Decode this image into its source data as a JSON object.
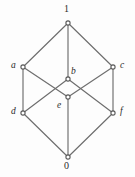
{
  "figure": {
    "kind": "hasse-diagram",
    "background_color": "#fdfdfd",
    "edge_color": "#6d6d6d",
    "vertex_fill_color": "#ffffff",
    "vertex_stroke_color": "#5a5a5a",
    "label_color": "#2b2b2b"
  },
  "nodes": [
    {
      "id": "top",
      "label": "1",
      "style": "numeral",
      "x": 68,
      "y": 23,
      "label_x": 64,
      "label_y": 4
    },
    {
      "id": "a",
      "label": "a",
      "style": "italic",
      "x": 23,
      "y": 67,
      "label_x": 11,
      "label_y": 60
    },
    {
      "id": "c",
      "label": "c",
      "style": "italic",
      "x": 113,
      "y": 67,
      "label_x": 120,
      "label_y": 60
    },
    {
      "id": "b",
      "label": "b",
      "style": "italic",
      "x": 68,
      "y": 79,
      "label_x": 71,
      "label_y": 66
    },
    {
      "id": "e",
      "label": "e",
      "style": "italic",
      "x": 68,
      "y": 97,
      "label_x": 57,
      "label_y": 100
    },
    {
      "id": "d",
      "label": "d",
      "style": "italic",
      "x": 23,
      "y": 113,
      "label_x": 11,
      "label_y": 106
    },
    {
      "id": "f",
      "label": "f",
      "style": "italic",
      "x": 113,
      "y": 113,
      "label_x": 120,
      "label_y": 106
    },
    {
      "id": "bottom",
      "label": "0",
      "style": "numeral",
      "x": 68,
      "y": 157,
      "label_x": 64,
      "label_y": 161
    }
  ],
  "edges": [
    {
      "from": "top",
      "to": "a"
    },
    {
      "from": "top",
      "to": "c"
    },
    {
      "from": "top",
      "to": "b"
    },
    {
      "from": "a",
      "to": "d"
    },
    {
      "from": "c",
      "to": "f"
    },
    {
      "from": "a",
      "to": "e"
    },
    {
      "from": "c",
      "to": "e"
    },
    {
      "from": "b",
      "to": "d"
    },
    {
      "from": "b",
      "to": "f"
    },
    {
      "from": "d",
      "to": "bottom"
    },
    {
      "from": "f",
      "to": "bottom"
    },
    {
      "from": "e",
      "to": "bottom"
    }
  ]
}
